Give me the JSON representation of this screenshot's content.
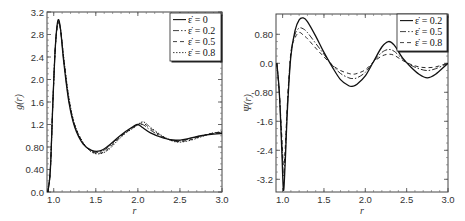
{
  "chart_data": [
    {
      "type": "line",
      "title": "",
      "xlabel": "r",
      "ylabel": "g(r)",
      "xlim": [
        0.92,
        3.0
      ],
      "ylim": [
        0.0,
        3.2
      ],
      "xticks": [
        1.0,
        1.5,
        2.0,
        2.5,
        3.0
      ],
      "xtick_labels": [
        "1.0",
        "1.5",
        "2.0",
        "2.5",
        "3.0"
      ],
      "yticks": [
        0.0,
        0.4,
        0.8,
        1.2,
        1.6,
        2.0,
        2.4,
        2.8,
        3.2
      ],
      "ytick_labels": [
        "0.0",
        "0.40",
        "0.80",
        "1.2",
        "1.6",
        "2.0",
        "2.4",
        "2.8",
        "3.2"
      ],
      "grid": false,
      "legend_position": "upper right",
      "series": [
        {
          "name": "ε̇ = 0",
          "dash": "",
          "x": [
            0.93,
            0.96,
            0.99,
            1.02,
            1.05,
            1.08,
            1.12,
            1.18,
            1.25,
            1.35,
            1.45,
            1.55,
            1.65,
            1.75,
            1.85,
            1.95,
            2.0,
            2.05,
            2.15,
            2.3,
            2.45,
            2.6,
            2.75,
            2.9,
            3.0
          ],
          "y": [
            0.0,
            0.4,
            1.6,
            2.6,
            3.05,
            2.9,
            2.3,
            1.6,
            1.15,
            0.85,
            0.74,
            0.73,
            0.82,
            0.95,
            1.07,
            1.17,
            1.2,
            1.15,
            1.05,
            0.96,
            0.92,
            0.95,
            1.0,
            1.03,
            1.04
          ]
        },
        {
          "name": "ε̇ = 0.2",
          "dash": "6,2,1.5,2",
          "x": [
            0.93,
            0.96,
            0.99,
            1.02,
            1.05,
            1.08,
            1.12,
            1.18,
            1.25,
            1.35,
            1.45,
            1.55,
            1.65,
            1.75,
            1.85,
            1.95,
            2.02,
            2.07,
            2.15,
            2.3,
            2.45,
            2.6,
            2.75,
            2.9,
            3.0
          ],
          "y": [
            0.0,
            0.4,
            1.6,
            2.6,
            3.03,
            2.9,
            2.33,
            1.63,
            1.17,
            0.86,
            0.73,
            0.71,
            0.8,
            0.94,
            1.06,
            1.16,
            1.2,
            1.19,
            1.1,
            0.97,
            0.91,
            0.94,
            1.0,
            1.04,
            1.05
          ]
        },
        {
          "name": "ε̇ = 0.5",
          "dash": "4,3",
          "x": [
            0.93,
            0.96,
            0.99,
            1.02,
            1.05,
            1.08,
            1.12,
            1.18,
            1.25,
            1.35,
            1.45,
            1.55,
            1.65,
            1.75,
            1.85,
            1.95,
            2.03,
            2.08,
            2.15,
            2.3,
            2.45,
            2.6,
            2.75,
            2.9,
            3.0
          ],
          "y": [
            0.0,
            0.4,
            1.6,
            2.6,
            3.0,
            2.9,
            2.36,
            1.66,
            1.19,
            0.87,
            0.72,
            0.69,
            0.77,
            0.92,
            1.05,
            1.15,
            1.22,
            1.21,
            1.13,
            0.98,
            0.9,
            0.92,
            0.99,
            1.05,
            1.06
          ]
        },
        {
          "name": "ε̇ = 0.8",
          "dash": "1.5,1.5",
          "x": [
            0.93,
            0.96,
            0.99,
            1.02,
            1.05,
            1.08,
            1.12,
            1.18,
            1.25,
            1.35,
            1.45,
            1.55,
            1.65,
            1.75,
            1.85,
            1.95,
            2.04,
            2.09,
            2.15,
            2.3,
            2.45,
            2.6,
            2.75,
            2.9,
            3.0
          ],
          "y": [
            0.0,
            0.4,
            1.6,
            2.6,
            2.98,
            2.9,
            2.38,
            1.68,
            1.2,
            0.88,
            0.71,
            0.68,
            0.75,
            0.9,
            1.04,
            1.14,
            1.24,
            1.23,
            1.15,
            0.99,
            0.89,
            0.91,
            0.98,
            1.05,
            1.07
          ]
        }
      ]
    },
    {
      "type": "line",
      "title": "",
      "xlabel": "r",
      "ylabel": "Ψ(r)",
      "xlim": [
        0.92,
        3.0
      ],
      "ylim": [
        -3.55,
        1.36
      ],
      "xticks": [
        1.0,
        1.5,
        2.0,
        2.5,
        3.0
      ],
      "xtick_labels": [
        "1.0",
        "1.5",
        "2.0",
        "2.5",
        "3.0"
      ],
      "yticks": [
        0.8,
        0.0,
        -0.8,
        -1.6,
        -2.4,
        -3.2
      ],
      "ytick_labels": [
        "0.80",
        "0.0",
        "-0.80",
        "-1.6",
        "-2.4",
        "-3.2"
      ],
      "grid": false,
      "legend_position": "upper right",
      "series": [
        {
          "name": "ε̇ = 0.2",
          "dash": "",
          "x": [
            0.93,
            0.96,
            0.99,
            1.01,
            1.03,
            1.06,
            1.1,
            1.15,
            1.2,
            1.25,
            1.3,
            1.4,
            1.5,
            1.6,
            1.7,
            1.8,
            1.85,
            1.9,
            2.0,
            2.1,
            2.2,
            2.28,
            2.35,
            2.45,
            2.55,
            2.65,
            2.75,
            2.85,
            2.95,
            3.0
          ],
          "y": [
            0.0,
            -0.8,
            -2.4,
            -3.5,
            -2.8,
            -1.2,
            0.2,
            0.9,
            1.2,
            1.25,
            1.15,
            0.75,
            0.3,
            -0.1,
            -0.45,
            -0.62,
            -0.63,
            -0.58,
            -0.35,
            0.05,
            0.45,
            0.6,
            0.5,
            0.15,
            -0.1,
            -0.3,
            -0.4,
            -0.3,
            -0.1,
            0.0
          ]
        },
        {
          "name": "ε̇ = 0.5",
          "dash": "6,2,1.5,2",
          "x": [
            0.93,
            0.96,
            0.99,
            1.01,
            1.03,
            1.06,
            1.1,
            1.15,
            1.2,
            1.25,
            1.3,
            1.4,
            1.5,
            1.6,
            1.7,
            1.8,
            1.85,
            1.9,
            2.0,
            2.1,
            2.2,
            2.28,
            2.35,
            2.45,
            2.55,
            2.65,
            2.75,
            2.85,
            2.95,
            3.0
          ],
          "y": [
            0.0,
            -0.8,
            -2.2,
            -3.1,
            -2.6,
            -1.1,
            0.25,
            0.8,
            0.97,
            0.95,
            0.85,
            0.55,
            0.25,
            -0.05,
            -0.28,
            -0.4,
            -0.42,
            -0.4,
            -0.25,
            0.05,
            0.3,
            0.38,
            0.33,
            0.12,
            -0.05,
            -0.15,
            -0.2,
            -0.15,
            -0.05,
            0.0
          ]
        },
        {
          "name": "ε̇ = 0.8",
          "dash": "4,3",
          "x": [
            0.93,
            0.96,
            0.99,
            1.01,
            1.03,
            1.06,
            1.1,
            1.15,
            1.2,
            1.25,
            1.3,
            1.4,
            1.5,
            1.6,
            1.7,
            1.8,
            1.85,
            1.9,
            2.0,
            2.1,
            2.2,
            2.28,
            2.35,
            2.45,
            2.55,
            2.65,
            2.75,
            2.85,
            2.95,
            3.0
          ],
          "y": [
            0.0,
            -0.8,
            -2.0,
            -2.8,
            -2.4,
            -1.0,
            0.3,
            0.7,
            0.85,
            0.78,
            0.68,
            0.42,
            0.18,
            -0.05,
            -0.2,
            -0.28,
            -0.3,
            -0.28,
            -0.18,
            0.04,
            0.2,
            0.25,
            0.22,
            0.08,
            -0.03,
            -0.1,
            -0.12,
            -0.1,
            -0.03,
            0.0
          ]
        }
      ]
    }
  ],
  "legend_symbol": "ε̇"
}
